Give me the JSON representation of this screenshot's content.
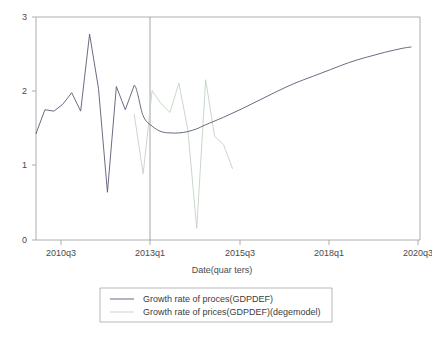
{
  "chart_data": {
    "type": "line",
    "title": "",
    "xlabel": "Date(quar ters)",
    "ylabel": "",
    "xlim": [
      2010.25,
      2021.0
    ],
    "ylim": [
      -0.12,
      3.15
    ],
    "yticks": [
      0,
      1,
      2,
      3
    ],
    "ytick_labels": [
      "0",
      "1",
      "2",
      "3"
    ],
    "xticks": [
      2010.5,
      2013.0,
      2015.5,
      2018.0,
      2020.5
    ],
    "xtick_labels": [
      "2010q3",
      "2013q1",
      "2015q3",
      "2018q1",
      "2020q3"
    ],
    "grid": false,
    "legend_position": "bottom",
    "forecast_divider_x": 2013.0,
    "colors": {
      "actual": "#5a5a74",
      "model": "#c3d2c3",
      "frame": "#9a9a9a",
      "divider": "#8d8d9a",
      "background": "#ffffff"
    },
    "series": [
      {
        "name": "Growth rate of proces(GDPDEF)",
        "color": "#5a5a74",
        "x": [
          2010.25,
          2010.5,
          2010.75,
          2011.0,
          2011.25,
          2011.5,
          2011.75,
          2012.0,
          2012.25,
          2012.5,
          2012.75,
          2013.0,
          2013.25,
          2013.5,
          2013.75,
          2014.0,
          2014.25,
          2014.5,
          2014.75,
          2015.0,
          2015.5,
          2016.0,
          2016.5,
          2017.0,
          2017.5,
          2018.0,
          2018.5,
          2019.0,
          2019.5,
          2020.0,
          2020.5,
          2020.75
        ],
        "y": [
          1.44,
          1.79,
          1.77,
          1.87,
          2.04,
          1.77,
          2.9,
          2.1,
          0.58,
          2.13,
          1.79,
          2.15,
          1.7,
          1.55,
          1.47,
          1.45,
          1.45,
          1.47,
          1.51,
          1.57,
          1.68,
          1.8,
          1.93,
          2.06,
          2.18,
          2.28,
          2.38,
          2.48,
          2.56,
          2.63,
          2.69,
          2.71
        ],
        "note": "historical quarterly values through 2013q1 then smooth model forecast"
      },
      {
        "name": "Growth rate of prices(GDPDEF)(degemodel)",
        "color": "#c3d2c3",
        "x": [
          2013.0,
          2013.25,
          2013.5,
          2013.75,
          2014.0,
          2014.25,
          2014.5,
          2014.75,
          2015.0,
          2015.25,
          2015.5,
          2015.75
        ],
        "y": [
          1.72,
          0.85,
          2.07,
          1.88,
          1.75,
          2.18,
          1.5,
          0.05,
          2.23,
          1.4,
          1.28,
          0.93
        ],
        "note": "dege model simulated path starting at the 2013q1 divider"
      }
    ]
  },
  "legend": {
    "entries": [
      {
        "label": "Growth rate of proces(GDPDEF)"
      },
      {
        "label": "Growth rate of prices(GDPDEF)(degemodel)"
      }
    ]
  }
}
